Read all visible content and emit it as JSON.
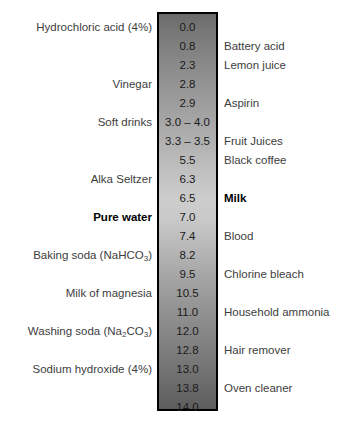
{
  "chart_data": {
    "type": "table",
    "xlabel": "",
    "ylabel": "pH",
    "ylim": [
      0,
      14
    ],
    "grid": false,
    "legend": "none",
    "orientation": "vertical",
    "gradient": {
      "description": "vertical grayscale gradient, dark at acidic top, lightest near neutral pH 7, darkening again toward alkaline bottom",
      "top_color": "#6b6b6b",
      "mid_color": "#cdcdcd",
      "bottom_color": "#5d5d5d",
      "border_color": "#000000"
    },
    "columns": [
      "left_label",
      "ph",
      "right_label"
    ],
    "rows": [
      {
        "left": "Hydrochloric acid (4%)",
        "ph": "0.0",
        "right": "",
        "left_bold": false,
        "right_bold": false,
        "left_sub": null
      },
      {
        "left": "",
        "ph": "0.8",
        "right": "Battery acid",
        "left_bold": false,
        "right_bold": false,
        "left_sub": null
      },
      {
        "left": "",
        "ph": "2.3",
        "right": "Lemon juice",
        "left_bold": false,
        "right_bold": false,
        "left_sub": null
      },
      {
        "left": "Vinegar",
        "ph": "2.8",
        "right": "",
        "left_bold": false,
        "right_bold": false,
        "left_sub": null
      },
      {
        "left": "",
        "ph": "2.9",
        "right": "Aspirin",
        "left_bold": false,
        "right_bold": false,
        "left_sub": null
      },
      {
        "left": "Soft drinks",
        "ph": "3.0 – 4.0",
        "right": "",
        "left_bold": false,
        "right_bold": false,
        "left_sub": null
      },
      {
        "left": "",
        "ph": "3.3 – 3.5",
        "right": "Fruit Juices",
        "left_bold": false,
        "right_bold": false,
        "left_sub": null
      },
      {
        "left": "",
        "ph": "5.5",
        "right": "Black coffee",
        "left_bold": false,
        "right_bold": false,
        "left_sub": null
      },
      {
        "left": "Alka Seltzer",
        "ph": "6.3",
        "right": "",
        "left_bold": false,
        "right_bold": false,
        "left_sub": null
      },
      {
        "left": "",
        "ph": "6.5",
        "right": "Milk",
        "left_bold": false,
        "right_bold": true,
        "left_sub": null
      },
      {
        "left": "Pure water",
        "ph": "7.0",
        "right": "",
        "left_bold": true,
        "right_bold": false,
        "left_sub": null
      },
      {
        "left": "",
        "ph": "7.4",
        "right": "Blood",
        "left_bold": false,
        "right_bold": false,
        "left_sub": null
      },
      {
        "left": "Baking soda (NaHCO",
        "ph": "8.2",
        "right": "",
        "left_bold": false,
        "right_bold": false,
        "left_sub": "3",
        "left_tail": ")"
      },
      {
        "left": "",
        "ph": "9.5",
        "right": "Chlorine bleach",
        "left_bold": false,
        "right_bold": false,
        "left_sub": null
      },
      {
        "left": "Milk of magnesia",
        "ph": "10.5",
        "right": "",
        "left_bold": false,
        "right_bold": false,
        "left_sub": null
      },
      {
        "left": "",
        "ph": "11.0",
        "right": "Household ammonia",
        "left_bold": false,
        "right_bold": false,
        "left_sub": null
      },
      {
        "left": "Washing soda (Na",
        "ph": "12.0",
        "right": "",
        "left_bold": false,
        "right_bold": false,
        "left_sub": "2",
        "left_mid": "CO",
        "left_sub2": "3",
        "left_tail": ")"
      },
      {
        "left": "",
        "ph": "12.8",
        "right": "Hair remover",
        "left_bold": false,
        "right_bold": false,
        "left_sub": null
      },
      {
        "left": "Sodium hydroxide (4%)",
        "ph": "13.0",
        "right": "",
        "left_bold": false,
        "right_bold": false,
        "left_sub": null
      },
      {
        "left": "",
        "ph": "13.8",
        "right": "Oven cleaner",
        "left_bold": false,
        "right_bold": false,
        "left_sub": null
      },
      {
        "left": "",
        "ph": "14.0",
        "right": "",
        "left_bold": false,
        "right_bold": false,
        "left_sub": null
      }
    ]
  }
}
